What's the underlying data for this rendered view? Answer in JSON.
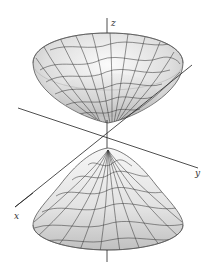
{
  "figure": {
    "axes": {
      "x_label": "x",
      "y_label": "y",
      "z_label": "z"
    },
    "colors": {
      "axis": "#222222",
      "mesh": "#333333",
      "surface_light": "#f2f2f2",
      "surface_dark": "#b8b8b8"
    }
  }
}
